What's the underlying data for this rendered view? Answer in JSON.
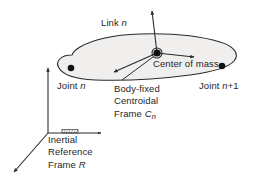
{
  "figure": {
    "background_color": "#ffffff",
    "line_color": "#2b2b2b",
    "body_fill_color": "#f0efee",
    "marker_color": "#111111"
  },
  "labels": {
    "link": {
      "text": "Link ",
      "italic": "n"
    },
    "center_of_mass": {
      "text": "Center of mass"
    },
    "joint_n": {
      "text": "Joint ",
      "italic": "n"
    },
    "joint_n_plus_1": {
      "text": "Joint ",
      "italic": "n",
      "suffix": "+1"
    },
    "body_fixed_frame": {
      "line1": "Body-fixed",
      "line2": "Centroidal",
      "line3": "Frame ",
      "line3_italic": "C",
      "line3_sub": "n"
    },
    "inertial_frame": {
      "line1": "Inertial",
      "line2": "Reference",
      "line3": "Frame ",
      "line3_italic": "R"
    }
  },
  "elements": {
    "link_body": "rounded elongated blob",
    "joint_n_marker": "filled dot",
    "joint_n_plus_1_marker": "filled dot",
    "center_of_mass_marker": "filled circle with ring",
    "centroidal_axes": [
      "up",
      "right",
      "down-left"
    ],
    "inertial_axes": [
      "up",
      "right",
      "down-left"
    ],
    "ground_hatch": "hatched ground symbol"
  }
}
